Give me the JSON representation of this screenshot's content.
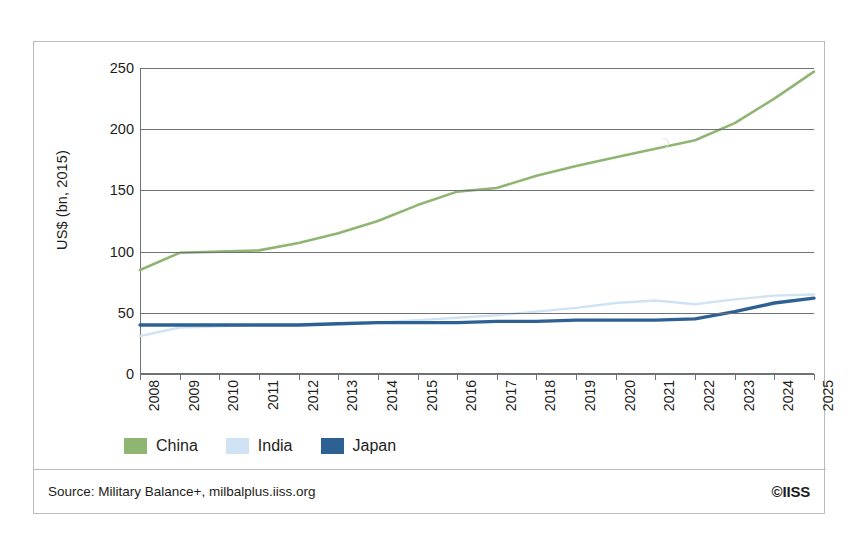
{
  "figure": {
    "y_axis_title": "US$ (bn, 2015)",
    "source_text": "Source: Military Balance+, milbalplus.iiss.org",
    "copyright": "©IISS"
  },
  "legend": {
    "entries": [
      {
        "label": "China",
        "color": "#8fb573"
      },
      {
        "label": "India",
        "color": "#cfe3f4"
      },
      {
        "label": "Japan",
        "color": "#2d6194"
      }
    ]
  },
  "chart_data": {
    "type": "line",
    "title": "",
    "subtitle": "",
    "xlabel": "",
    "ylabel": "US$ (bn, 2015)",
    "xlim": [
      2008,
      2025
    ],
    "ylim": [
      0,
      250
    ],
    "grid": true,
    "legend_position": "bottom-left",
    "categories": [
      2008,
      2009,
      2010,
      2011,
      2012,
      2013,
      2014,
      2015,
      2016,
      2017,
      2018,
      2019,
      2020,
      2021,
      2022,
      2023,
      2024,
      2025
    ],
    "yticks": [
      0,
      50,
      100,
      150,
      200,
      250
    ],
    "xticks": [
      "2008",
      "2009",
      "2010",
      "2011",
      "2012",
      "2013",
      "2014",
      "2015",
      "2016",
      "2017",
      "2018",
      "2019",
      "2020",
      "2021",
      "2022",
      "2023",
      "2024",
      "2025"
    ],
    "series": [
      {
        "name": "China",
        "color": "#8fb573",
        "values": [
          85,
          99,
          100,
          101,
          107,
          115,
          125,
          138,
          149,
          152,
          162,
          170,
          177,
          184,
          191,
          205,
          225,
          247
        ]
      },
      {
        "name": "India",
        "color": "#cfe3f4",
        "values": [
          31,
          38,
          39,
          40,
          40,
          41,
          42,
          44,
          46,
          48,
          51,
          54,
          58,
          60,
          57,
          61,
          64,
          65
        ]
      },
      {
        "name": "Japan",
        "color": "#2d6194",
        "values": [
          40,
          40,
          40,
          40,
          40,
          41,
          42,
          42,
          42,
          43,
          43,
          44,
          44,
          44,
          45,
          51,
          58,
          62
        ]
      }
    ]
  }
}
